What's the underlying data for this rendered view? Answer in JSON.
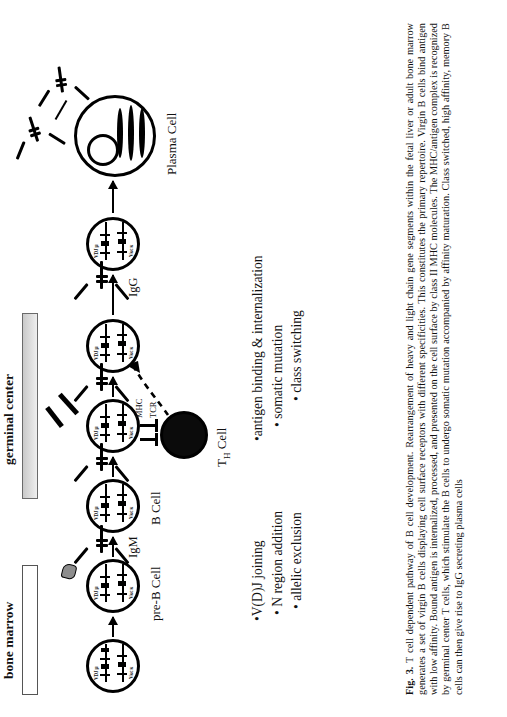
{
  "figure": {
    "compartments": [
      {
        "name": "bone marrow",
        "label": "bone marrow"
      },
      {
        "name": "germinal center",
        "label": "germinal center"
      }
    ],
    "cell_labels": [
      {
        "id": "pre-b-cell",
        "label": "pre-B Cell"
      },
      {
        "id": "b-cell",
        "label": "B Cell"
      },
      {
        "id": "th-cell",
        "label": "T",
        "sub": "H",
        "tail": " Cell",
        "full": "TH Cell"
      },
      {
        "id": "plasma-cell",
        "label": "Plasma Cell"
      }
    ],
    "immunoglobulin_labels": [
      {
        "id": "igm",
        "label": "IgM"
      },
      {
        "id": "igg",
        "label": "IgG"
      }
    ],
    "receptor_labels": [
      {
        "id": "mhc",
        "label": "MHC"
      },
      {
        "id": "tcr",
        "label": "TCR"
      }
    ],
    "gene_labels": {
      "heavy": "VDJ μ",
      "light": "Vκc κ"
    },
    "bullets_left": {
      "title": "bone-marrow-events",
      "items": [
        "V(D)J joining",
        "N region addition",
        "allelic exclusion"
      ]
    },
    "bullets_right": {
      "title": "germinal-center-events",
      "items": [
        "antigen binding & internalization",
        "somatic mutation",
        "class switching"
      ]
    },
    "caption": {
      "figure_number": "Fig. 3.",
      "text": "T cell dependent pathway of B cell development. Rearrangement of heavy and light chain gene segments within the fetal liver or adult bone marrow generates a set of virgin B cells displaying cell surface receptors with different specificities. This constitutes the primary repertoire. Virgin B cells bind antigen with low affinity. Bound antigen is internalized, processed, and presented on the cell surface by class II MHC molecules. The MHC/antigen complex is recognized by germinal center T cells, which stimulate the B cells to undergo somatic mutation accompanied by affinity maturation. Class switched, high affinity, memory B cells can then give rise to IgG secreting plasma cells"
    },
    "colors": {
      "ink": "#111111",
      "paper": "#ffffff",
      "bar_shaded": "#c9c9c9",
      "antigen": "#8d8d8d"
    }
  }
}
